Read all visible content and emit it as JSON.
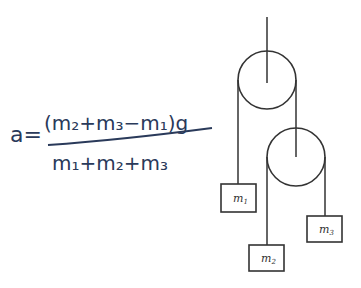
{
  "equation": {
    "lhs": "a",
    "equals": "=",
    "numerator": "(m₂+m₃−m₁)g",
    "denominator": "m₁+m₂+m₃",
    "ink_color": "#2a3a5a"
  },
  "diagram": {
    "stroke_color": "#333333",
    "pulleys": [
      {
        "name": "upper-pulley",
        "cx": 267,
        "cy": 80,
        "r": 29
      },
      {
        "name": "lower-pulley",
        "cx": 296,
        "cy": 157,
        "r": 29
      }
    ],
    "masses": [
      {
        "name": "m1",
        "base": "m",
        "sub": "1",
        "x": 221,
        "y": 184,
        "w": 35,
        "h": 28
      },
      {
        "name": "m2",
        "base": "m",
        "sub": "2",
        "x": 249,
        "y": 245,
        "w": 35,
        "h": 26
      },
      {
        "name": "m3",
        "base": "m",
        "sub": "3",
        "x": 307,
        "y": 216,
        "w": 35,
        "h": 26
      }
    ]
  }
}
